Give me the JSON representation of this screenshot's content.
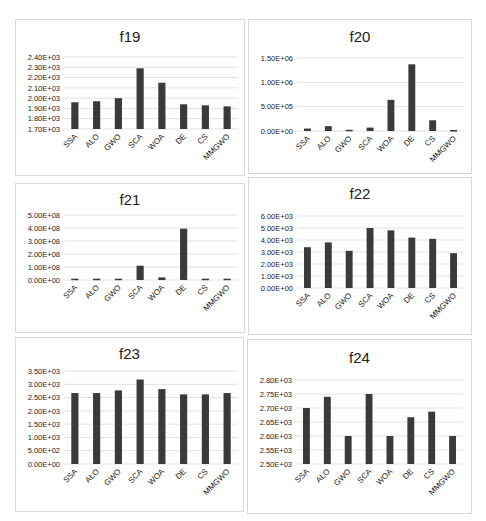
{
  "chart_data": [
    {
      "type": "bar",
      "title": "f19",
      "categories": [
        "SSA",
        "ALO",
        "GWO",
        "SCA",
        "WOA",
        "DE",
        "CS",
        "MMGWO"
      ],
      "values": [
        1960,
        1970,
        2000,
        2290,
        2150,
        1940,
        1930,
        1920
      ],
      "yticks": [
        "1.70E+03",
        "1.80E+03",
        "1.90E+03",
        "2.00E+03",
        "2.10E+03",
        "2.20E+03",
        "2.30E+03",
        "2.40E+03"
      ],
      "ylim": [
        1700,
        2400
      ],
      "xlabel": "",
      "ylabel": "",
      "grid": true,
      "legend": null
    },
    {
      "type": "bar",
      "title": "f20",
      "categories": [
        "SSA",
        "ALO",
        "GWO",
        "SCA",
        "WOA",
        "DE",
        "CS",
        "MMGWO"
      ],
      "values": [
        50000,
        100000,
        25000,
        70000,
        640000,
        1370000,
        220000,
        20000
      ],
      "yticks": [
        "0.00E+00",
        "5.00E+05",
        "1.00E+06",
        "1.50E+06"
      ],
      "ylim": [
        0,
        1500000
      ],
      "xlabel": "",
      "ylabel": "",
      "grid": true,
      "legend": null
    },
    {
      "type": "bar",
      "title": "f21",
      "categories": [
        "SSA",
        "ALO",
        "GWO",
        "SCA",
        "WOA",
        "DE",
        "CS",
        "MMGWO"
      ],
      "values": [
        10000000,
        10000000,
        10000000,
        110000000,
        20000000,
        395000000,
        10000000,
        10000000
      ],
      "yticks": [
        "0.00E+00",
        "1.00E+08",
        "2.00E+08",
        "3.00E+08",
        "4.00E+08",
        "5.00E+08"
      ],
      "ylim": [
        0,
        500000000
      ],
      "xlabel": "",
      "ylabel": "",
      "grid": true,
      "legend": null
    },
    {
      "type": "bar",
      "title": "f22",
      "categories": [
        "SSA",
        "ALO",
        "GWO",
        "SCA",
        "WOA",
        "DE",
        "CS",
        "MMGWO"
      ],
      "values": [
        3400,
        3800,
        3100,
        5000,
        4800,
        4200,
        4100,
        2900
      ],
      "yticks": [
        "0.00E+00",
        "1.00E+03",
        "2.00E+03",
        "3.00E+03",
        "4.00E+03",
        "5.00E+03",
        "6.00E+03"
      ],
      "ylim": [
        0,
        6000
      ],
      "xlabel": "",
      "ylabel": "",
      "grid": true,
      "legend": null
    },
    {
      "type": "bar",
      "title": "f23",
      "categories": [
        "SSA",
        "ALO",
        "GWO",
        "SCA",
        "WOA",
        "DE",
        "CS",
        "MMGWO"
      ],
      "values": [
        2670,
        2670,
        2770,
        3180,
        2820,
        2620,
        2620,
        2670
      ],
      "yticks": [
        "0.00E+00",
        "5.00E+02",
        "1.00E+03",
        "1.50E+03",
        "2.00E+03",
        "2.50E+03",
        "3.00E+03",
        "3.50E+03"
      ],
      "ylim": [
        0,
        3500
      ],
      "xlabel": "",
      "ylabel": "",
      "grid": true,
      "legend": null
    },
    {
      "type": "bar",
      "title": "f24",
      "categories": [
        "SSA",
        "ALO",
        "GWO",
        "SCA",
        "WOA",
        "DE",
        "CS",
        "MMGWO"
      ],
      "values": [
        2700,
        2740,
        2600,
        2750,
        2600,
        2667,
        2687,
        2600
      ],
      "yticks": [
        "2.50E+03",
        "2.55E+03",
        "2.60E+03",
        "2.65E+03",
        "2.70E+03",
        "2.75E+03",
        "2.80E+03"
      ],
      "ylim": [
        2500,
        2800
      ],
      "xlabel": "",
      "ylabel": "",
      "grid": true,
      "legend": null
    }
  ],
  "panels": [
    {
      "title": "f19"
    },
    {
      "title": "f20"
    },
    {
      "title": "f21"
    },
    {
      "title": "f22"
    },
    {
      "title": "f23"
    },
    {
      "title": "f24"
    }
  ]
}
